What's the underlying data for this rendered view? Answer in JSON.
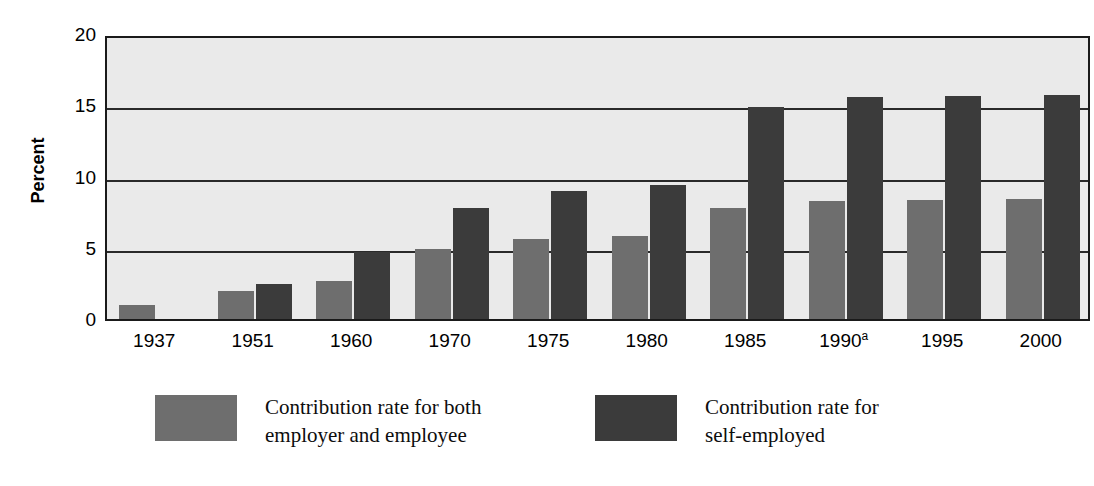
{
  "chart_data": {
    "type": "bar",
    "title": "",
    "xlabel": "",
    "ylabel": "Percent",
    "ylim": [
      0,
      20
    ],
    "yticks": [
      "0",
      "5",
      "10",
      "15",
      "20"
    ],
    "ytick_values": [
      0,
      5,
      10,
      15,
      20
    ],
    "grid": true,
    "legend_position": "bottom",
    "categories": [
      "1937",
      "1951",
      "1960",
      "1970",
      "1975",
      "1980",
      "1985",
      "1990",
      "1995",
      "2000"
    ],
    "category_labels": [
      "1937",
      "1951",
      "1960",
      "1970",
      "1975",
      "1980",
      "1985",
      "1990a",
      "1995",
      "2000"
    ],
    "category_footnotes": [
      "",
      "",
      "",
      "",
      "",
      "",
      "",
      "a",
      "",
      ""
    ],
    "series": [
      {
        "name": "Contribution rate for both employer and employee",
        "color": "#6e6e6e",
        "values": [
          1.0,
          2.0,
          2.7,
          4.9,
          5.6,
          5.8,
          7.8,
          8.3,
          8.35,
          8.45
        ]
      },
      {
        "name": "Contribution rate for self-employed",
        "color": "#3b3b3b",
        "values": [
          null,
          2.45,
          4.7,
          7.8,
          9.0,
          9.4,
          14.85,
          15.6,
          15.65,
          15.7
        ]
      }
    ]
  },
  "legend": {
    "entries": [
      {
        "swatch": "light",
        "line1": "Contribution rate for both",
        "line2": "employer and employee"
      },
      {
        "swatch": "dark",
        "line1": "Contribution rate for",
        "line2": "self-employed"
      }
    ]
  },
  "colors": {
    "plot_background": "#eaeaea",
    "axis": "#1a1a1a",
    "series_light": "#6e6e6e",
    "series_dark": "#3b3b3b"
  }
}
